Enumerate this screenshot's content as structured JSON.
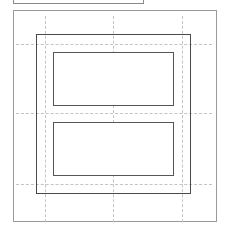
{
  "preview": {
    "colors": {
      "page_border": "#9a9a9a",
      "guide": "#c4c4c4",
      "frame": "#4a4a4a",
      "label_border": "#555555",
      "background": "#ffffff"
    },
    "guides": {
      "vertical_x": [
        45,
        113,
        182
      ],
      "horizontal_y": [
        44,
        113,
        184
      ]
    },
    "labels": [
      {
        "id": "label-1"
      },
      {
        "id": "label-2"
      }
    ]
  }
}
